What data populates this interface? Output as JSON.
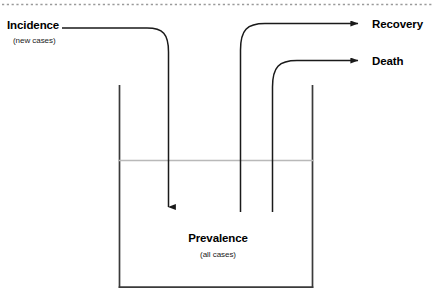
{
  "diagram": {
    "top_rule": {
      "style": "dotted",
      "color": "#9a9a9a"
    },
    "colors": {
      "stroke": "#1a1a1a",
      "water_line": "#b9b9b9",
      "tank": "#3a3a3a",
      "text": "#000000",
      "background": "#ffffff"
    },
    "labels": {
      "incidence": "Incidence",
      "incidence_sub": "(new cases)",
      "recovery": "Recovery",
      "death": "Death",
      "prevalence": "Prevalence",
      "prevalence_sub": "(all cases)"
    },
    "flows": [
      {
        "name": "incidence-inflow",
        "from": "Incidence",
        "to": "Prevalence",
        "direction": "down-into-tank"
      },
      {
        "name": "recovery-outflow",
        "from": "Prevalence",
        "to": "Recovery",
        "direction": "up-out-right"
      },
      {
        "name": "death-outflow",
        "from": "Prevalence",
        "to": "Death",
        "direction": "up-out-right"
      }
    ]
  }
}
